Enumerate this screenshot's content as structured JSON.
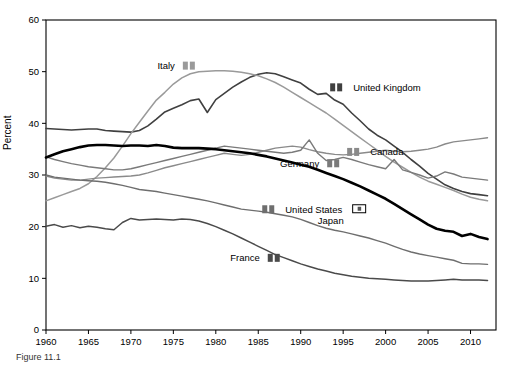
{
  "figure": {
    "caption": "Figure 11.1"
  },
  "chart_data": {
    "type": "line",
    "title": "",
    "xlabel": "",
    "ylabel": "Percent",
    "xlim": [
      1960,
      2013
    ],
    "ylim": [
      0,
      60
    ],
    "grid": false,
    "legend_position": "inline-annotations",
    "xticks": [
      1960,
      1965,
      1970,
      1975,
      1980,
      1985,
      1990,
      1995,
      2000,
      2005,
      2010
    ],
    "yticks": [
      0,
      10,
      20,
      30,
      40,
      50,
      60
    ],
    "x": [
      1960,
      1961,
      1962,
      1963,
      1964,
      1965,
      1966,
      1967,
      1968,
      1969,
      1970,
      1971,
      1972,
      1973,
      1974,
      1975,
      1976,
      1977,
      1978,
      1979,
      1980,
      1981,
      1982,
      1983,
      1984,
      1985,
      1986,
      1987,
      1988,
      1989,
      1990,
      1991,
      1992,
      1993,
      1994,
      1995,
      1996,
      1997,
      1998,
      1999,
      2000,
      2001,
      2002,
      2003,
      2004,
      2005,
      2006,
      2007,
      2008,
      2009,
      2010,
      2011,
      2012
    ],
    "series": [
      {
        "name": "United Kingdom",
        "color": "#404040",
        "width": 1.6,
        "label_x": 1995,
        "label_y": 46.0,
        "marker": "square",
        "values": [
          39.0,
          38.9,
          38.8,
          38.7,
          38.8,
          38.9,
          38.9,
          38.6,
          38.5,
          38.4,
          38.3,
          38.6,
          39.5,
          40.8,
          42.2,
          42.9,
          43.6,
          44.4,
          44.7,
          42.1,
          44.6,
          45.8,
          47.0,
          48.0,
          48.9,
          49.5,
          49.8,
          49.6,
          49.0,
          48.4,
          47.8,
          46.6,
          45.6,
          45.8,
          44.5,
          43.7,
          42.0,
          40.5,
          38.9,
          37.7,
          36.8,
          35.6,
          34.4,
          33.0,
          31.7,
          30.3,
          29.2,
          28.1,
          27.4,
          26.8,
          26.4,
          26.2,
          26.0
        ]
      },
      {
        "name": "Italy",
        "color": "#9a9a9a",
        "width": 1.5,
        "label_x": 1976,
        "label_y": 50.2,
        "marker": "square",
        "values": [
          25.0,
          25.6,
          26.2,
          26.8,
          27.4,
          28.3,
          29.7,
          31.4,
          33.3,
          35.6,
          38.0,
          40.2,
          42.4,
          44.5,
          46.0,
          47.6,
          48.8,
          49.6,
          50.0,
          50.1,
          50.2,
          50.2,
          50.1,
          49.9,
          49.6,
          49.2,
          48.6,
          47.9,
          47.0,
          46.0,
          45.0,
          44.0,
          43.0,
          42.0,
          40.8,
          39.6,
          38.4,
          37.2,
          36.0,
          34.8,
          33.6,
          32.5,
          31.5,
          30.5,
          29.6,
          28.8,
          28.2,
          27.6,
          27.0,
          26.3,
          25.7,
          25.3,
          25.0
        ]
      },
      {
        "name": "Canada",
        "color": "#8a8a8a",
        "width": 1.4,
        "label_x": 1997,
        "label_y": 33.5,
        "marker": "square",
        "values": [
          29.8,
          29.4,
          29.2,
          29.0,
          29.0,
          29.2,
          29.4,
          29.5,
          29.6,
          29.7,
          29.8,
          30.0,
          30.4,
          30.9,
          31.4,
          31.8,
          32.2,
          32.6,
          33.0,
          33.4,
          33.8,
          34.2,
          34.0,
          33.8,
          34.0,
          34.4,
          34.8,
          35.2,
          35.4,
          35.6,
          35.4,
          34.9,
          34.5,
          34.2,
          34.0,
          33.9,
          34.0,
          34.2,
          34.4,
          34.6,
          34.8,
          34.6,
          34.5,
          34.6,
          34.8,
          35.0,
          35.4,
          36.0,
          36.4,
          36.6,
          36.8,
          37.0,
          37.2
        ]
      },
      {
        "name": "Germany",
        "color": "#7a7a7a",
        "width": 1.4,
        "label_x": 1993,
        "label_y": 31.3,
        "marker": "square",
        "values": [
          33.5,
          33.0,
          32.6,
          32.2,
          31.9,
          31.6,
          31.4,
          31.2,
          31.0,
          31.0,
          31.2,
          31.6,
          32.0,
          32.4,
          32.8,
          33.2,
          33.6,
          34.0,
          34.4,
          34.8,
          35.2,
          35.6,
          35.4,
          35.2,
          35.0,
          34.8,
          34.6,
          34.4,
          34.2,
          34.4,
          34.8,
          36.8,
          34.2,
          32.8,
          33.0,
          33.4,
          33.0,
          32.5,
          32.0,
          31.6,
          31.2,
          33.0,
          31.0,
          30.5,
          30.0,
          29.4,
          29.8,
          30.6,
          30.2,
          29.6,
          29.4,
          29.2,
          29.0
        ]
      },
      {
        "name": "Japan",
        "color": "#000000",
        "width": 2.6,
        "label_x": 1996,
        "label_y": 22.5,
        "marker": "square-open",
        "values": [
          33.4,
          34.0,
          34.6,
          35.0,
          35.4,
          35.7,
          35.8,
          35.8,
          35.7,
          35.6,
          35.7,
          35.7,
          35.6,
          35.8,
          35.6,
          35.3,
          35.2,
          35.2,
          35.2,
          35.1,
          35.0,
          34.8,
          34.6,
          34.4,
          34.2,
          33.9,
          33.6,
          33.2,
          32.8,
          32.4,
          32.0,
          31.6,
          31.0,
          30.4,
          29.8,
          29.2,
          28.5,
          27.8,
          27.0,
          26.2,
          25.4,
          24.4,
          23.4,
          22.4,
          21.4,
          20.4,
          19.6,
          19.2,
          19.0,
          18.2,
          18.6,
          18.0,
          17.6
        ]
      },
      {
        "name": "United States",
        "color": "#6e6e6e",
        "width": 1.4,
        "label_x": 1987,
        "label_y": 22.4,
        "marker": "square",
        "values": [
          30.0,
          29.6,
          29.4,
          29.2,
          29.0,
          28.9,
          28.8,
          28.6,
          28.3,
          28.0,
          27.6,
          27.2,
          27.0,
          26.8,
          26.5,
          26.2,
          25.9,
          25.6,
          25.3,
          25.0,
          24.6,
          24.2,
          23.8,
          23.4,
          23.2,
          23.0,
          22.8,
          22.5,
          22.2,
          21.9,
          21.4,
          20.8,
          20.2,
          19.7,
          19.3,
          19.0,
          18.6,
          18.2,
          17.8,
          17.3,
          16.8,
          16.2,
          15.6,
          15.1,
          14.7,
          14.4,
          14.1,
          13.8,
          13.5,
          12.9,
          12.8,
          12.8,
          12.7
        ]
      },
      {
        "name": "France",
        "color": "#4a4a4a",
        "width": 1.5,
        "label_x": 1986,
        "label_y": 13.0,
        "marker": "square",
        "values": [
          20.1,
          20.4,
          19.9,
          20.2,
          19.8,
          20.1,
          19.9,
          19.6,
          19.4,
          20.8,
          21.6,
          21.3,
          21.4,
          21.5,
          21.4,
          21.3,
          21.5,
          21.4,
          21.1,
          20.6,
          20.0,
          19.3,
          18.6,
          17.8,
          17.0,
          16.2,
          15.4,
          14.6,
          14.0,
          13.4,
          12.8,
          12.3,
          11.8,
          11.4,
          11.0,
          10.7,
          10.4,
          10.2,
          10.0,
          9.9,
          9.8,
          9.7,
          9.6,
          9.5,
          9.5,
          9.5,
          9.6,
          9.7,
          9.8,
          9.7,
          9.7,
          9.7,
          9.6
        ]
      }
    ]
  }
}
